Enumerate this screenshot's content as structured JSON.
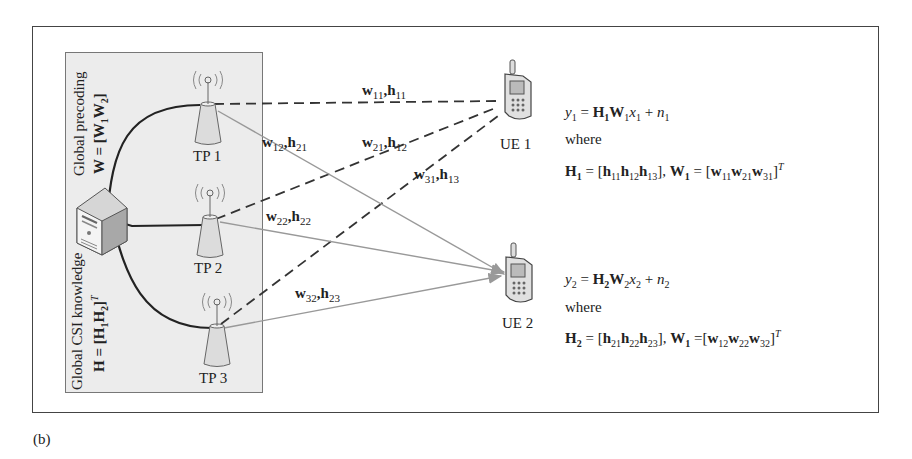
{
  "figure": {
    "caption": "(b)",
    "panel": {
      "precoding_label": "Global precoding",
      "precoding_formula": "W = [W1W2]",
      "csi_label": "Global CSI knowledge",
      "csi_formula": "H = [H1H2]^T"
    },
    "transmission_points": [
      {
        "label": "TP 1"
      },
      {
        "label": "TP 2"
      },
      {
        "label": "TP 3"
      }
    ],
    "user_equipment": [
      {
        "label": "UE 1"
      },
      {
        "label": "UE 2"
      }
    ],
    "link_labels": [
      {
        "w": "w",
        "wsub": "11",
        "h": "h",
        "hsub": "11",
        "style": "dashed"
      },
      {
        "w": "w",
        "wsub": "12",
        "h": "h",
        "hsub": "21",
        "style": "solid"
      },
      {
        "w": "w",
        "wsub": "21",
        "h": "h",
        "hsub": "12",
        "style": "dashed"
      },
      {
        "w": "w",
        "wsub": "31",
        "h": "h",
        "hsub": "13",
        "style": "dashed"
      },
      {
        "w": "w",
        "wsub": "22",
        "h": "h",
        "hsub": "22",
        "style": "solid"
      },
      {
        "w": "w",
        "wsub": "32",
        "h": "h",
        "hsub": "23",
        "style": "solid"
      }
    ],
    "equations": {
      "ue1": {
        "signal": "y1 = H1W1x1 + n1",
        "where": "where",
        "definition": "H1 = [h11h12h13], W1 = [w11w21w31]^T"
      },
      "ue2": {
        "signal": "y2 = H2W2x2 + n2",
        "where": "where",
        "definition": "H2 = [h21h22h23], W1 =[w12w22w32]^T"
      }
    },
    "colors": {
      "frame": "#444444",
      "panel_bg": "#ececec",
      "backhaul": "#222222",
      "dashed_link": "#333333",
      "solid_link": "#999999"
    }
  }
}
